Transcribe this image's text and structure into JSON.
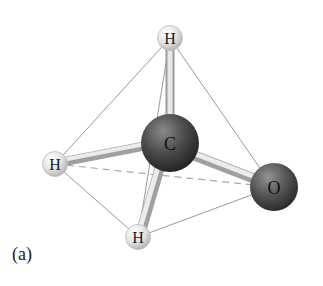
{
  "figure": {
    "caption": "(a)",
    "molecule": "formaldehyde-like tetrahedral model",
    "atoms": [
      {
        "id": "H1",
        "label": "H",
        "position": "top"
      },
      {
        "id": "C",
        "label": "C",
        "position": "center"
      },
      {
        "id": "H2",
        "label": "H",
        "position": "left"
      },
      {
        "id": "O",
        "label": "O",
        "position": "right"
      },
      {
        "id": "H3",
        "label": "H",
        "position": "bottom"
      }
    ],
    "colors": {
      "hydrogen": "#e6e6e6",
      "carbon": "#4a4a4a",
      "oxygen": "#505050",
      "bond": "#cfcfcf",
      "edge_line": "#9a9a9a",
      "hidden_edge": "#a8a8a8"
    }
  }
}
